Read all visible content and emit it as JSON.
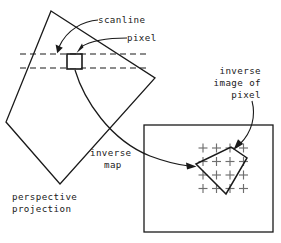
{
  "figure": {
    "background_color": "#ffffff",
    "line_color": "#1a1a1a",
    "grid_color": "#6f6f6f",
    "width": 281,
    "height": 243
  },
  "labels": {
    "scanline": "scanline",
    "pixel": "pixel",
    "inverse_image_line1": "inverse",
    "inverse_image_line2": "image of",
    "inverse_image_line3": "pixel",
    "inverse_map_line1": "inverse",
    "inverse_map_line2": "map",
    "perspective_line1": "perspective",
    "perspective_line2": "projection"
  },
  "shapes": {
    "perspective_quad": {
      "name": "perspective-projection-quad",
      "points": "51,11 155,78 60,184 6,122"
    },
    "scanline_upper": {
      "x1": 20,
      "y1": 54,
      "x2": 146,
      "y2": 54
    },
    "scanline_lower": {
      "x1": 20,
      "y1": 68,
      "x2": 146,
      "y2": 68
    },
    "pixel_square": {
      "x": 67,
      "y": 54,
      "width": 15,
      "height": 15
    },
    "inverse_box": {
      "x": 144,
      "y": 125,
      "width": 129,
      "height": 107
    },
    "inverse_quad": {
      "name": "inverse-image-quad",
      "points": "196,164 231,147 247,158 226,194"
    },
    "crosshair_grid": {
      "origin_x": 203,
      "origin_y": 148,
      "step_x": 13.5,
      "step_y": 13.5,
      "cols": 4,
      "rows": 4,
      "arm": 4.5
    }
  },
  "arrows": {
    "scanline_arrow": "scanline leader to upper dashed line",
    "pixel_arrow": "pixel leader to pixel square",
    "inverse_map_arrow": "curve from pixel square to inverse image quad",
    "inverse_image_arrow": "curve from inverse image label to quad corner"
  }
}
